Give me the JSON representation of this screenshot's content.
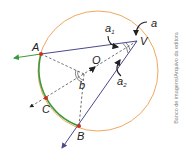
{
  "diagram": {
    "type": "inscribed-angle-geometry",
    "points": {
      "A": {
        "label": "A"
      },
      "B": {
        "label": "B"
      },
      "C": {
        "label": "C"
      },
      "O": {
        "label": "O"
      },
      "V": {
        "label": "V"
      }
    },
    "angles": {
      "a": {
        "label": "a"
      },
      "a1": {
        "label": "a",
        "sub": "1"
      },
      "a2": {
        "label": "a",
        "sub": "2"
      },
      "b": {
        "label": "b"
      }
    },
    "colors": {
      "circle": "#f0a860",
      "arc": "#3a9a3a",
      "lines": "#4a4a8a",
      "points": "#d03020",
      "dashed": "#333333"
    }
  },
  "credit": "Banco de imagens/Arquivo da editora"
}
